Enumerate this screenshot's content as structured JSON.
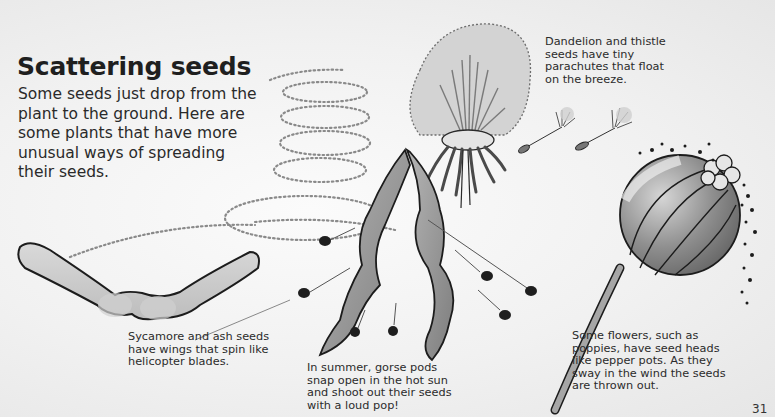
{
  "page": {
    "title": "Scattering seeds",
    "intro": "Some seeds just drop from the plant to the ground. Here are some plants that have more unusual ways of spreading their seeds.",
    "page_number": "31"
  },
  "captions": {
    "dandelion": "Dandelion and thistle\nseeds have tiny\nparachutes that float\non the breeze.",
    "sycamore": "Sycamore and ash seeds\nhave wings that spin like\nhelicopter blades.",
    "gorse": "In summer, gorse pods\nsnap open in the hot sun\nand shoot out their seeds\nwith a loud pop!",
    "poppy": "Some flowers, such as\npoppies, have seed heads\nlike pepper pots. As they\nsway in the wind the seeds\nare thrown out."
  },
  "illustrations": [
    {
      "name": "sycamore-seed",
      "description": "Winged sycamore seed with dotted spiral flight path"
    },
    {
      "name": "dandelion-clock",
      "description": "Dandelion seed head with floating parachute seeds"
    },
    {
      "name": "gorse-pods",
      "description": "Twisted gorse pods shooting out seeds"
    },
    {
      "name": "poppy-head",
      "description": "Poppy seed head scattering seeds"
    }
  ],
  "colors": {
    "ink": "#1f1f1f",
    "mid_grey": "#9a9a9a",
    "light_grey": "#cfcfcf",
    "paper": "#f3f3f3"
  }
}
